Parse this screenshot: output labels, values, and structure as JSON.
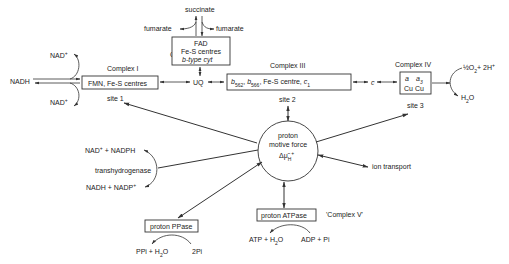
{
  "complex1": {
    "label": "Complex I",
    "content": "FMN, Fe-S centres"
  },
  "complex2": {
    "label": "Complex II",
    "line1": "FAD",
    "line2": "Fe-S centres",
    "line3": "b-type cyt"
  },
  "complex3": {
    "label": "Complex III",
    "b562": "b",
    "b562_sub": "562",
    "b566": "b",
    "b566_sub": "566",
    "rest": "Fe-S centre,",
    "c1": "c",
    "c1_sub": "1"
  },
  "complex4": {
    "label": "Complex IV",
    "a": "a",
    "a3": "a",
    "a3_sub": "3",
    "cu": "Cu  Cu"
  },
  "complex5": {
    "label": "proton ATPase",
    "alias": "'Complex V'",
    "left": "ATP + H",
    "left_sub": "2",
    "left_end": "O",
    "right": "ADP + Pi"
  },
  "ppase": {
    "label": "proton PPase",
    "left": "PPi + H",
    "left_sub": "2",
    "left_end": "O",
    "right": "2Pi"
  },
  "nadh": "NADH",
  "nad_top": "NAD",
  "nad_bottom": "NAD",
  "plus": "+",
  "succinate": "succinate",
  "fumarate_left": "fumarate",
  "fumarate_right": "fumarate",
  "uq": "UQ",
  "cyt_c": "c",
  "oxygen": {
    "half": "½O",
    "sub": "2",
    "rest": "+ 2H",
    "sup": "+"
  },
  "water": {
    "h": "H",
    "sub": "2",
    "o": "O"
  },
  "sites": {
    "site1": "site 1",
    "site2": "site 2",
    "site3": "site 3"
  },
  "pmf": {
    "line1": "proton",
    "line2": "motive force",
    "symbol": "Δμ̃",
    "sub": "H",
    "sup": "+"
  },
  "ion_transport": "ion transport",
  "transhydrogenase": {
    "label": "transhydrogenase",
    "top": "NAD",
    "top_rest": " + NADPH",
    "bottom": "NADH + NADP"
  }
}
